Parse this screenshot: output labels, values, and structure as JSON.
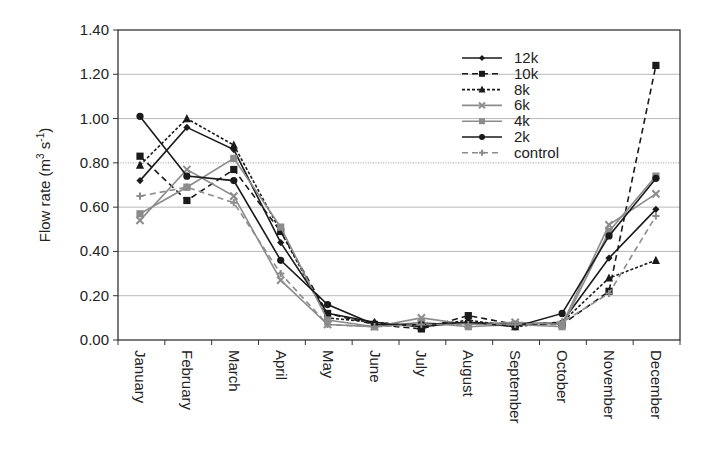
{
  "chart_data": {
    "type": "line",
    "title": "",
    "xlabel": "",
    "ylabel": "Flow rate (m3 s-1)",
    "ylabel_parts": {
      "base": "Flow rate (m",
      "sup1": "3",
      "mid": " s",
      "sup2": "-1",
      "end": ")"
    },
    "ylim": [
      0,
      1.4
    ],
    "yticks": [
      "0.00",
      "0.20",
      "0.40",
      "0.60",
      "0.80",
      "1.00",
      "1.20",
      "1.40"
    ],
    "grid": true,
    "legend_position": "upper-right-inside",
    "categories": [
      "January",
      "February",
      "March",
      "April",
      "May",
      "June",
      "July",
      "August",
      "September",
      "October",
      "November",
      "December"
    ],
    "series": [
      {
        "name": "12k",
        "color": "#1a1a1a",
        "dash": "",
        "marker": "diamond",
        "values": [
          0.72,
          0.96,
          0.86,
          0.44,
          0.12,
          0.08,
          0.06,
          0.08,
          0.07,
          0.08,
          0.37,
          0.59
        ]
      },
      {
        "name": "10k",
        "color": "#1a1a1a",
        "dash": "6,4",
        "marker": "square",
        "values": [
          0.83,
          0.63,
          0.77,
          0.49,
          0.12,
          0.07,
          0.05,
          0.11,
          0.07,
          0.07,
          0.22,
          1.24
        ]
      },
      {
        "name": "8k",
        "color": "#1a1a1a",
        "dash": "3,2",
        "marker": "triangle",
        "values": [
          0.79,
          1.0,
          0.88,
          0.49,
          0.1,
          0.08,
          0.06,
          0.09,
          0.06,
          0.08,
          0.28,
          0.36
        ]
      },
      {
        "name": "6k",
        "color": "#8c8c8c",
        "dash": "",
        "marker": "x",
        "values": [
          0.54,
          0.77,
          0.65,
          0.27,
          0.07,
          0.06,
          0.1,
          0.07,
          0.08,
          0.07,
          0.52,
          0.66
        ]
      },
      {
        "name": "4k",
        "color": "#8c8c8c",
        "dash": "",
        "marker": "square",
        "values": [
          0.57,
          0.69,
          0.82,
          0.51,
          0.09,
          0.06,
          0.08,
          0.06,
          0.07,
          0.06,
          0.49,
          0.74
        ]
      },
      {
        "name": "2k",
        "color": "#1a1a1a",
        "dash": "",
        "marker": "circle",
        "values": [
          1.01,
          0.74,
          0.72,
          0.36,
          0.16,
          0.07,
          0.07,
          0.08,
          0.06,
          0.12,
          0.47,
          0.73
        ]
      },
      {
        "name": "control",
        "color": "#8c8c8c",
        "dash": "6,4",
        "marker": "plus",
        "values": [
          0.65,
          0.69,
          0.62,
          0.3,
          0.07,
          0.06,
          0.07,
          0.07,
          0.07,
          0.08,
          0.21,
          0.56
        ]
      }
    ]
  },
  "layout": {
    "plot": {
      "left": 118,
      "top": 30,
      "right": 680,
      "bottom": 340
    },
    "first_x": 140,
    "step_x": 46.9,
    "legend": {
      "x": 462,
      "y": 58,
      "row_h": 15.8
    }
  }
}
